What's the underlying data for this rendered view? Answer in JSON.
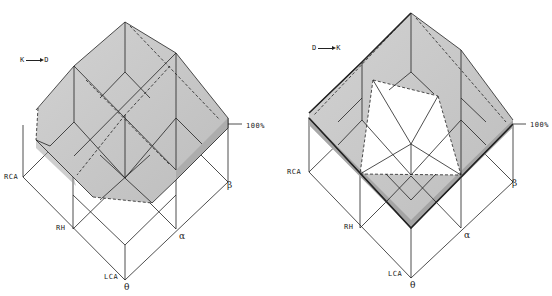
{
  "figure": {
    "left_panel": {
      "direction_from": "K",
      "direction_to": "D",
      "level_label": "100%",
      "axis_labels": {
        "rca": "RCA",
        "rh": "RH",
        "lca": "LCA",
        "theta": "θ",
        "alpha": "α",
        "beta": "β"
      }
    },
    "right_panel": {
      "direction_from": "D",
      "direction_to": "K",
      "level_label": "100%",
      "axis_labels": {
        "rca": "RCA",
        "rh": "RH",
        "lca": "LCA",
        "theta": "θ",
        "alpha": "α",
        "beta": "β"
      }
    },
    "colors": {
      "shade": "#c9c9c9",
      "line": "#222222",
      "background": "#ffffff"
    }
  }
}
